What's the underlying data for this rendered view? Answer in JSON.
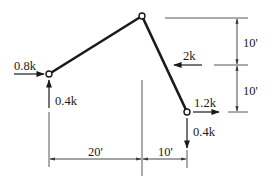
{
  "diagram": {
    "type": "three-hinged frame / truss member loading",
    "colors": {
      "member": "#1a1a1a",
      "dimension": "#333333",
      "background": "#ffffff"
    },
    "joints": [
      {
        "id": "left",
        "x": 49,
        "y": 74
      },
      {
        "id": "apex",
        "x": 142,
        "y": 16
      },
      {
        "id": "right",
        "x": 187,
        "y": 112
      }
    ],
    "loads": {
      "left_horizontal": {
        "label": "0.8k",
        "direction": "right"
      },
      "left_vertical": {
        "label": "0.4k",
        "direction": "up"
      },
      "middle_horizontal": {
        "label": "2k",
        "direction": "left"
      },
      "right_horizontal": {
        "label": "1.2k",
        "direction": "right"
      },
      "right_vertical": {
        "label": "0.4k",
        "direction": "down"
      }
    },
    "dimensions": {
      "horizontal_left": "20'",
      "horizontal_right": "10'",
      "vertical_top": "10'",
      "vertical_bottom": "10'"
    }
  }
}
